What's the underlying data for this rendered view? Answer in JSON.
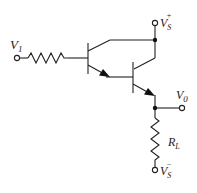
{
  "diagram": {
    "type": "circuit-schematic",
    "colors": {
      "wire": "#222222",
      "background": "#ffffff"
    },
    "labels": {
      "input": {
        "main": "V",
        "sub": "1"
      },
      "supply_positive": {
        "main": "V",
        "sub": "S",
        "sup": "+"
      },
      "output": {
        "main": "V",
        "sub": "0"
      },
      "load_resistor": {
        "main": "R",
        "sub": "L"
      },
      "supply_negative": {
        "main": "V",
        "sub": "S",
        "sup": "−"
      }
    },
    "components": [
      {
        "id": "R_in",
        "kind": "resistor",
        "between": [
          "V1",
          "Q1.base"
        ]
      },
      {
        "id": "Q1",
        "kind": "npn-transistor",
        "collector": "VS+",
        "emitter": "Q2.base"
      },
      {
        "id": "Q2",
        "kind": "npn-transistor",
        "collector": "VS+",
        "emitter": "V0"
      },
      {
        "id": "RL",
        "kind": "resistor",
        "between": [
          "V0",
          "VS-"
        ]
      }
    ]
  }
}
